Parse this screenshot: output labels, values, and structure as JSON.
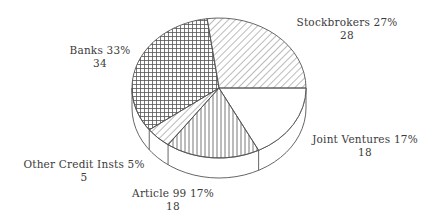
{
  "chart_data": {
    "type": "pie",
    "style": "3d-pie-hatched",
    "title": "",
    "slices": [
      {
        "label": "Stockbrokers",
        "percent": "27%",
        "value": 28,
        "pattern": "diagonal-right"
      },
      {
        "label": "Joint Ventures",
        "percent": "17%",
        "value": 18,
        "pattern": "none"
      },
      {
        "label": "Article 99",
        "percent": "17%",
        "value": 18,
        "pattern": "vertical"
      },
      {
        "label": "Other Credit Insts",
        "percent": "5%",
        "value": 5,
        "pattern": "diagonal-right"
      },
      {
        "label": "Banks",
        "percent": "33%",
        "value": 34,
        "pattern": "crosshatch"
      }
    ],
    "legend": "none",
    "labels_outside": true
  },
  "labels": {
    "stockbrokers": {
      "line1": "Stockbrokers 27%",
      "line2": "28"
    },
    "joint_ventures": {
      "line1": "Joint Ventures 17%",
      "line2": "18"
    },
    "article99": {
      "line1": "Article 99 17%",
      "line2": "18"
    },
    "other_credit": {
      "line1": "Other Credit Insts 5%",
      "line2": "5"
    },
    "banks": {
      "line1": "Banks 33%",
      "line2": "34"
    }
  },
  "colors": {
    "line": "#555555",
    "background": "#ffffff"
  }
}
